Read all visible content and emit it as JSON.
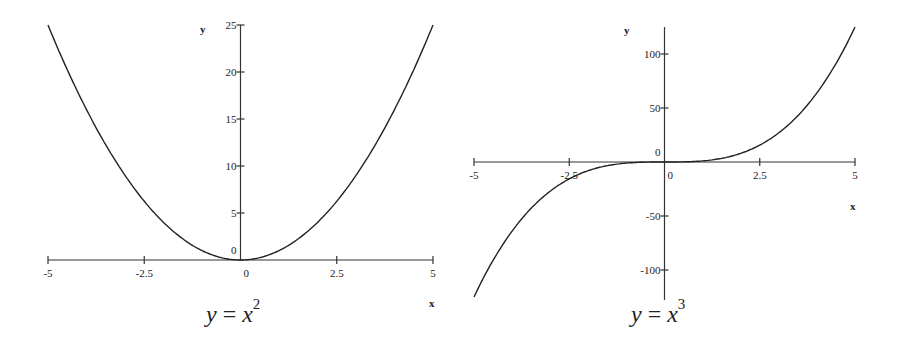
{
  "chart_data": [
    {
      "type": "line",
      "title": "y = x^2",
      "caption": {
        "lhs": "y",
        "eq": "=",
        "base": "x",
        "exp": "2"
      },
      "xlabel": "x",
      "ylabel": "y",
      "xlim": [
        -5,
        5
      ],
      "ylim": [
        0,
        25
      ],
      "grid": false,
      "legend": null,
      "x_ticks": [
        "-5",
        "-2.5",
        "0",
        "2.5",
        "5"
      ],
      "y_ticks": [
        "0",
        "5",
        "10",
        "15",
        "20",
        "25"
      ],
      "x": [
        -5,
        -4,
        -3,
        -2,
        -1,
        0,
        1,
        2,
        3,
        4,
        5
      ],
      "series": [
        {
          "name": "x^2",
          "values": [
            25,
            16,
            9,
            4,
            1,
            0,
            1,
            4,
            9,
            16,
            25
          ]
        }
      ]
    },
    {
      "type": "line",
      "title": "y = x^3",
      "caption": {
        "lhs": "y",
        "eq": "=",
        "base": "x",
        "exp": "3"
      },
      "xlabel": "x",
      "ylabel": "y",
      "xlim": [
        -5,
        5
      ],
      "ylim": [
        -125,
        125
      ],
      "grid": false,
      "legend": null,
      "x_ticks": [
        "-5",
        "-2.5",
        "0",
        "2.5",
        "5"
      ],
      "y_ticks": [
        "-100",
        "-50",
        "0",
        "50",
        "100"
      ],
      "x": [
        -5,
        -4,
        -3,
        -2,
        -1,
        0,
        1,
        2,
        3,
        4,
        5
      ],
      "series": [
        {
          "name": "x^3",
          "values": [
            -125,
            -64,
            -27,
            -8,
            -1,
            0,
            1,
            8,
            27,
            64,
            125
          ]
        }
      ]
    }
  ]
}
